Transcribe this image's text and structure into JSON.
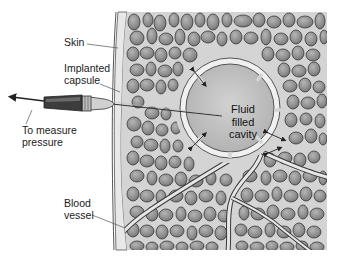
{
  "figure": {
    "type": "anatomical-diagram"
  },
  "labels": {
    "skin": "Skin",
    "implanted_capsule": "Implanted\ncapsule",
    "to_measure_pressure": "To measure\npressure",
    "blood_vessel": "Blood\nvessel",
    "fluid_filled_cavity": "Fluid\nfilled\ncavity"
  },
  "colors": {
    "background": "#ffffff",
    "tissue_fill": "#d6d6d6",
    "cell_fill": "#8c8c8c",
    "cell_outline": "#3a3a3a",
    "cavity_fill": "#bdbdbd",
    "capsule_wall": "#ececec",
    "skin_band": "#e2e2e2",
    "syringe_dark": "#3c3c3c",
    "syringe_light": "#c9c9c9",
    "text": "#1a1a1a"
  }
}
